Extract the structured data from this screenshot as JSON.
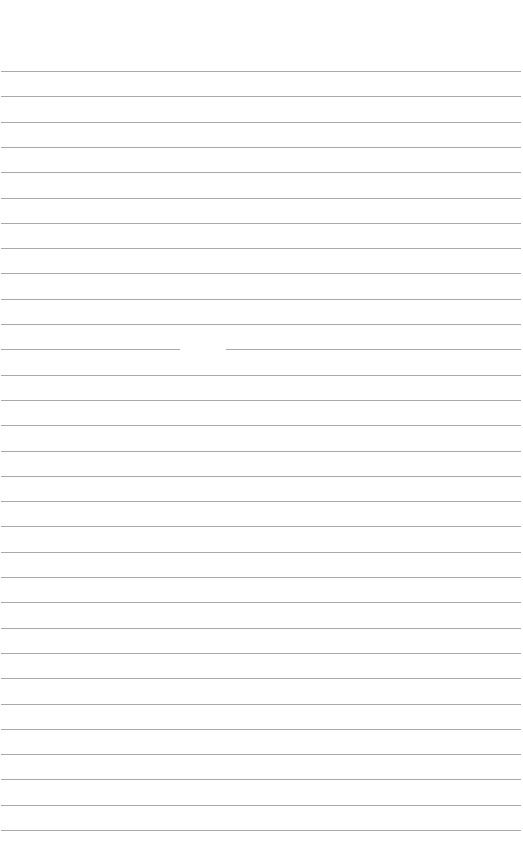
{
  "page": {
    "type": "lined-paper",
    "background_color": "#ffffff",
    "line_color": "#a9a9a9",
    "line_count": 31,
    "first_line_y": 71,
    "line_spacing": 25.3,
    "line_gaps": [
      {
        "line_index": 11,
        "x_start": 180,
        "x_end": 226
      }
    ]
  }
}
